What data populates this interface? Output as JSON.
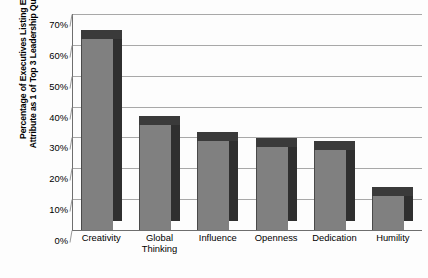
{
  "chart_data": {
    "type": "bar",
    "title": "",
    "xlabel": "",
    "ylabel": "Percentage of Executives Listing Each Attribute as 1 of Top 3 Leadership Qualities",
    "ylabel_lines": [
      "Percentage of Executives Listing Each",
      "Attribute as 1 of Top 3 Leadership Qualities"
    ],
    "categories": [
      "Creativity",
      "Global Thinking",
      "Influence",
      "Openness",
      "Dedication",
      "Humility"
    ],
    "category_lines": [
      [
        "Creativity"
      ],
      [
        "Global",
        "Thinking"
      ],
      [
        "Influence"
      ],
      [
        "Openness"
      ],
      [
        "Dedication"
      ],
      [
        "Humility"
      ]
    ],
    "values": [
      62,
      34,
      29,
      27,
      26,
      11
    ],
    "ylim": [
      0,
      70
    ],
    "ytick_values": [
      70,
      60,
      50,
      40,
      30,
      20,
      10,
      0
    ],
    "ytick_labels": [
      "70%",
      "60%",
      "50%",
      "40%",
      "30%",
      "20%",
      "10%",
      "0%"
    ],
    "grid": true,
    "legend": "none",
    "style": "3d-bar",
    "colors": {
      "bar_front": "#808080",
      "bar_side": "#2f2f2f",
      "bar_top": "#3a3a3a",
      "gridline": "#a8a8a8",
      "background": "#fdfdfd",
      "text": "#000000"
    }
  }
}
